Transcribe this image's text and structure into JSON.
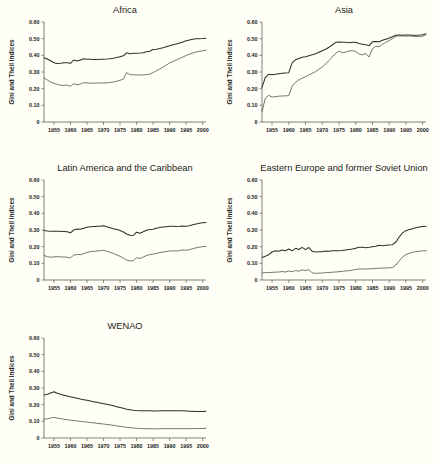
{
  "figure": {
    "background": "#fffff7",
    "axis_color": "#4a4a40",
    "gini_color": "#2e2e26",
    "theil_color": "#5d5d4e",
    "ylabel": "Gini and Theil Indices",
    "ytick_labels": [
      "0.60",
      "0.50",
      "0.40",
      "0.30",
      "0.20",
      "0.10",
      "0"
    ],
    "ytick_values": [
      0.6,
      0.5,
      0.4,
      0.3,
      0.2,
      0.1,
      0
    ],
    "xtick_labels": [
      "1955",
      "1960",
      "1965",
      "1970",
      "1975",
      "1980",
      "1985",
      "1990",
      "1995",
      "2000"
    ],
    "xtick_values": [
      1955,
      1960,
      1965,
      1970,
      1975,
      1980,
      1985,
      1990,
      1995,
      2000
    ],
    "xlim": [
      1952,
      2001
    ],
    "ylim": [
      0,
      0.6
    ],
    "panel_titles": [
      "Africa",
      "Asia",
      "Latin America and the Caribbean",
      "Eastern Europe and former Soviet Union",
      "WENAO"
    ]
  },
  "chart_data": [
    {
      "type": "line",
      "title": "Africa",
      "xlabel": "",
      "ylabel": "Gini and Theil Indices",
      "xlim": [
        1952,
        2001
      ],
      "ylim": [
        0,
        0.6
      ],
      "grid": false,
      "legend": "none",
      "x": [
        1952,
        1953,
        1954,
        1955,
        1956,
        1957,
        1958,
        1959,
        1960,
        1961,
        1962,
        1963,
        1964,
        1965,
        1966,
        1967,
        1968,
        1969,
        1970,
        1971,
        1972,
        1973,
        1974,
        1975,
        1976,
        1977,
        1978,
        1979,
        1980,
        1981,
        1982,
        1983,
        1984,
        1985,
        1986,
        1987,
        1988,
        1989,
        1990,
        1991,
        1992,
        1993,
        1994,
        1995,
        1996,
        1997,
        1998,
        1999,
        2000,
        2001
      ],
      "series": [
        {
          "name": "Gini",
          "values": [
            0.385,
            0.378,
            0.367,
            0.356,
            0.351,
            0.352,
            0.355,
            0.356,
            0.352,
            0.372,
            0.366,
            0.372,
            0.379,
            0.376,
            0.376,
            0.375,
            0.375,
            0.376,
            0.377,
            0.378,
            0.38,
            0.383,
            0.387,
            0.392,
            0.397,
            0.415,
            0.409,
            0.412,
            0.413,
            0.414,
            0.416,
            0.421,
            0.425,
            0.435,
            0.437,
            0.441,
            0.446,
            0.452,
            0.458,
            0.463,
            0.468,
            0.474,
            0.48,
            0.487,
            0.492,
            0.496,
            0.499,
            0.5,
            0.501,
            0.503
          ]
        },
        {
          "name": "Theil",
          "values": [
            0.265,
            0.252,
            0.24,
            0.232,
            0.226,
            0.221,
            0.219,
            0.222,
            0.214,
            0.23,
            0.223,
            0.228,
            0.236,
            0.235,
            0.233,
            0.233,
            0.234,
            0.234,
            0.234,
            0.235,
            0.237,
            0.24,
            0.245,
            0.25,
            0.258,
            0.296,
            0.284,
            0.283,
            0.283,
            0.282,
            0.282,
            0.285,
            0.287,
            0.297,
            0.307,
            0.317,
            0.33,
            0.342,
            0.354,
            0.363,
            0.372,
            0.381,
            0.39,
            0.399,
            0.407,
            0.414,
            0.42,
            0.424,
            0.427,
            0.431
          ]
        }
      ]
    },
    {
      "type": "line",
      "title": "Asia",
      "xlabel": "",
      "ylabel": "Gini and Theil Indices",
      "xlim": [
        1952,
        2001
      ],
      "ylim": [
        0,
        0.6
      ],
      "grid": false,
      "legend": "none",
      "x": [
        1952,
        1953,
        1954,
        1955,
        1956,
        1957,
        1958,
        1959,
        1960,
        1961,
        1962,
        1963,
        1964,
        1965,
        1966,
        1967,
        1968,
        1969,
        1970,
        1971,
        1972,
        1973,
        1974,
        1975,
        1976,
        1977,
        1978,
        1979,
        1980,
        1981,
        1982,
        1983,
        1984,
        1985,
        1986,
        1987,
        1988,
        1989,
        1990,
        1991,
        1992,
        1993,
        1994,
        1995,
        1996,
        1997,
        1998,
        1999,
        2000,
        2001
      ],
      "series": [
        {
          "name": "Gini",
          "values": [
            0.208,
            0.268,
            0.286,
            0.284,
            0.287,
            0.29,
            0.292,
            0.294,
            0.296,
            0.355,
            0.373,
            0.381,
            0.388,
            0.392,
            0.398,
            0.403,
            0.409,
            0.418,
            0.427,
            0.437,
            0.448,
            0.462,
            0.478,
            0.48,
            0.479,
            0.478,
            0.475,
            0.479,
            0.478,
            0.471,
            0.466,
            0.464,
            0.458,
            0.481,
            0.483,
            0.482,
            0.49,
            0.497,
            0.504,
            0.512,
            0.521,
            0.522,
            0.521,
            0.522,
            0.522,
            0.52,
            0.521,
            0.522,
            0.524,
            0.53
          ]
        },
        {
          "name": "Theil",
          "values": [
            0.062,
            0.143,
            0.16,
            0.15,
            0.152,
            0.155,
            0.156,
            0.157,
            0.158,
            0.215,
            0.238,
            0.252,
            0.263,
            0.272,
            0.282,
            0.292,
            0.302,
            0.316,
            0.33,
            0.348,
            0.368,
            0.39,
            0.412,
            0.425,
            0.416,
            0.419,
            0.427,
            0.428,
            0.423,
            0.408,
            0.403,
            0.412,
            0.39,
            0.44,
            0.455,
            0.452,
            0.466,
            0.478,
            0.489,
            0.5,
            0.515,
            0.517,
            0.516,
            0.515,
            0.516,
            0.514,
            0.513,
            0.512,
            0.515,
            0.524
          ]
        }
      ]
    },
    {
      "type": "line",
      "title": "Latin America and the Caribbean",
      "xlabel": "",
      "ylabel": "Gini and Theil Indices",
      "xlim": [
        1952,
        2001
      ],
      "ylim": [
        0,
        0.6
      ],
      "grid": false,
      "legend": "none",
      "x": [
        1952,
        1953,
        1954,
        1955,
        1956,
        1957,
        1958,
        1959,
        1960,
        1961,
        1962,
        1963,
        1964,
        1965,
        1966,
        1967,
        1968,
        1969,
        1970,
        1971,
        1972,
        1973,
        1974,
        1975,
        1976,
        1977,
        1978,
        1979,
        1980,
        1981,
        1982,
        1983,
        1984,
        1985,
        1986,
        1987,
        1988,
        1989,
        1990,
        1991,
        1992,
        1993,
        1994,
        1995,
        1996,
        1997,
        1998,
        1999,
        2000,
        2001
      ],
      "series": [
        {
          "name": "Gini",
          "values": [
            0.297,
            0.294,
            0.292,
            0.293,
            0.293,
            0.292,
            0.291,
            0.29,
            0.283,
            0.3,
            0.306,
            0.305,
            0.31,
            0.316,
            0.319,
            0.321,
            0.322,
            0.323,
            0.325,
            0.319,
            0.313,
            0.308,
            0.303,
            0.297,
            0.288,
            0.276,
            0.268,
            0.267,
            0.287,
            0.281,
            0.289,
            0.299,
            0.303,
            0.305,
            0.311,
            0.315,
            0.318,
            0.32,
            0.322,
            0.322,
            0.321,
            0.322,
            0.324,
            0.322,
            0.326,
            0.331,
            0.336,
            0.34,
            0.343,
            0.345
          ]
        },
        {
          "name": "Theil",
          "values": [
            0.147,
            0.14,
            0.137,
            0.139,
            0.14,
            0.139,
            0.138,
            0.137,
            0.133,
            0.149,
            0.153,
            0.152,
            0.158,
            0.165,
            0.17,
            0.172,
            0.174,
            0.176,
            0.178,
            0.172,
            0.166,
            0.159,
            0.151,
            0.142,
            0.131,
            0.12,
            0.114,
            0.115,
            0.134,
            0.129,
            0.137,
            0.147,
            0.152,
            0.155,
            0.16,
            0.164,
            0.168,
            0.171,
            0.174,
            0.175,
            0.174,
            0.176,
            0.181,
            0.178,
            0.183,
            0.188,
            0.193,
            0.197,
            0.2,
            0.202
          ]
        }
      ]
    },
    {
      "type": "line",
      "title": "Eastern Europe and former Soviet Union",
      "xlabel": "",
      "ylabel": "Gini and Theil Indices",
      "xlim": [
        1952,
        2001
      ],
      "ylim": [
        0,
        0.6
      ],
      "grid": false,
      "legend": "none",
      "x": [
        1952,
        1953,
        1954,
        1955,
        1956,
        1957,
        1958,
        1959,
        1960,
        1961,
        1962,
        1963,
        1964,
        1965,
        1966,
        1967,
        1968,
        1969,
        1970,
        1971,
        1972,
        1973,
        1974,
        1975,
        1976,
        1977,
        1978,
        1979,
        1980,
        1981,
        1982,
        1983,
        1984,
        1985,
        1986,
        1987,
        1988,
        1989,
        1990,
        1991,
        1992,
        1993,
        1994,
        1995,
        1996,
        1997,
        1998,
        1999,
        2000,
        2001
      ],
      "series": [
        {
          "name": "Gini",
          "values": [
            0.135,
            0.142,
            0.152,
            0.168,
            0.175,
            0.172,
            0.18,
            0.175,
            0.186,
            0.175,
            0.19,
            0.183,
            0.196,
            0.182,
            0.195,
            0.172,
            0.168,
            0.169,
            0.169,
            0.174,
            0.172,
            0.175,
            0.176,
            0.176,
            0.177,
            0.18,
            0.183,
            0.186,
            0.191,
            0.196,
            0.196,
            0.194,
            0.196,
            0.199,
            0.202,
            0.208,
            0.206,
            0.208,
            0.21,
            0.212,
            0.228,
            0.258,
            0.283,
            0.296,
            0.303,
            0.308,
            0.313,
            0.318,
            0.321,
            0.322
          ]
        },
        {
          "name": "Theil",
          "values": [
            0.043,
            0.044,
            0.045,
            0.046,
            0.047,
            0.048,
            0.051,
            0.048,
            0.054,
            0.05,
            0.057,
            0.053,
            0.061,
            0.057,
            0.062,
            0.043,
            0.04,
            0.041,
            0.042,
            0.044,
            0.045,
            0.047,
            0.048,
            0.05,
            0.052,
            0.054,
            0.056,
            0.059,
            0.063,
            0.066,
            0.067,
            0.066,
            0.067,
            0.068,
            0.069,
            0.071,
            0.071,
            0.072,
            0.073,
            0.075,
            0.09,
            0.115,
            0.138,
            0.152,
            0.16,
            0.166,
            0.17,
            0.173,
            0.175,
            0.176
          ]
        }
      ]
    },
    {
      "type": "line",
      "title": "WENAO",
      "xlabel": "",
      "ylabel": "Gini and Theil Indices",
      "xlim": [
        1952,
        2001
      ],
      "ylim": [
        0,
        0.6
      ],
      "grid": false,
      "legend": "none",
      "x": [
        1952,
        1953,
        1954,
        1955,
        1956,
        1957,
        1958,
        1959,
        1960,
        1961,
        1962,
        1963,
        1964,
        1965,
        1966,
        1967,
        1968,
        1969,
        1970,
        1971,
        1972,
        1973,
        1974,
        1975,
        1976,
        1977,
        1978,
        1979,
        1980,
        1981,
        1982,
        1983,
        1984,
        1985,
        1986,
        1987,
        1988,
        1989,
        1990,
        1991,
        1992,
        1993,
        1994,
        1995,
        1996,
        1997,
        1998,
        1999,
        2000,
        2001
      ],
      "series": [
        {
          "name": "Gini",
          "values": [
            0.258,
            0.262,
            0.27,
            0.278,
            0.268,
            0.262,
            0.257,
            0.252,
            0.247,
            0.243,
            0.239,
            0.234,
            0.23,
            0.226,
            0.222,
            0.218,
            0.214,
            0.21,
            0.206,
            0.202,
            0.198,
            0.193,
            0.188,
            0.183,
            0.178,
            0.173,
            0.17,
            0.167,
            0.165,
            0.164,
            0.163,
            0.163,
            0.163,
            0.162,
            0.162,
            0.163,
            0.163,
            0.163,
            0.163,
            0.163,
            0.163,
            0.163,
            0.163,
            0.162,
            0.161,
            0.16,
            0.159,
            0.159,
            0.159,
            0.16
          ]
        },
        {
          "name": "Theil",
          "values": [
            0.112,
            0.115,
            0.12,
            0.124,
            0.119,
            0.116,
            0.113,
            0.11,
            0.107,
            0.105,
            0.102,
            0.1,
            0.098,
            0.095,
            0.093,
            0.091,
            0.088,
            0.086,
            0.084,
            0.081,
            0.079,
            0.076,
            0.073,
            0.07,
            0.067,
            0.064,
            0.062,
            0.06,
            0.058,
            0.057,
            0.056,
            0.056,
            0.056,
            0.055,
            0.055,
            0.056,
            0.056,
            0.056,
            0.056,
            0.056,
            0.056,
            0.056,
            0.056,
            0.056,
            0.056,
            0.056,
            0.057,
            0.057,
            0.057,
            0.058
          ]
        }
      ]
    }
  ],
  "panel_positions": [
    {
      "left": 0,
      "top": 0,
      "width": 218,
      "height": 155
    },
    {
      "left": 218,
      "top": 0,
      "width": 220,
      "height": 155
    },
    {
      "left": 0,
      "top": 158,
      "width": 218,
      "height": 155
    },
    {
      "left": 218,
      "top": 158,
      "width": 220,
      "height": 155
    },
    {
      "left": 0,
      "top": 316,
      "width": 218,
      "height": 149
    }
  ]
}
